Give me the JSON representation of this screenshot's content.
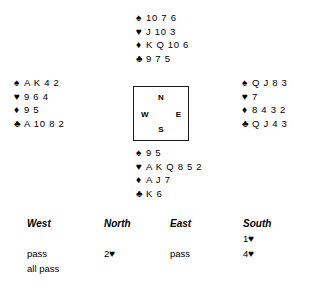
{
  "deal": {
    "suit_symbols": {
      "spade": "♠",
      "heart": "♥",
      "diamond": "♦",
      "club": "♣"
    },
    "hands": {
      "north": {
        "position": "North",
        "spades": "10 7 6",
        "hearts": "J 10 3",
        "diamonds": "K Q 10 6",
        "clubs": "9 7 5"
      },
      "west": {
        "position": "West",
        "spades": "A K 4 2",
        "hearts": "9 6 4",
        "diamonds": "9 5",
        "clubs": "A 10 8 2"
      },
      "east": {
        "position": "East",
        "spades": "Q J 8 3",
        "hearts": "7",
        "diamonds": "8 4 3 2",
        "clubs": "Q J 4 3"
      },
      "south": {
        "position": "South",
        "spades": "9 5",
        "hearts": "A K Q 8 5 2",
        "diamonds": "A J 7",
        "clubs": "K 6"
      }
    },
    "compass": {
      "north": "N",
      "west": "W",
      "east": "E",
      "south": "S"
    }
  },
  "auction": {
    "headers": {
      "west": "West",
      "north": "North",
      "east": "East",
      "south": "South"
    },
    "rows": [
      {
        "west": "",
        "north": "",
        "east": "",
        "south_level": "1",
        "south_suit": "♥"
      },
      {
        "west": "pass",
        "north_level": "2",
        "north_suit": "♥",
        "east": "pass",
        "south_level": "4",
        "south_suit": "♥"
      },
      {
        "west": "all pass",
        "north": "",
        "east": "",
        "south": ""
      }
    ]
  }
}
